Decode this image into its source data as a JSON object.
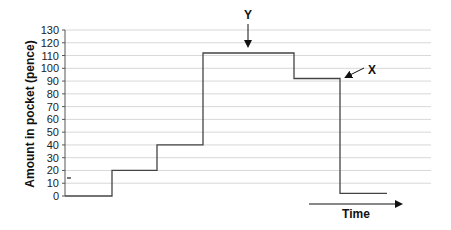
{
  "chart_data": {
    "type": "line",
    "subtype": "step",
    "title": "",
    "xlabel": "Time",
    "ylabel": "Amount in pocket (pence)",
    "ylim": [
      0,
      130
    ],
    "yticks": [
      0,
      10,
      20,
      30,
      40,
      50,
      60,
      70,
      80,
      90,
      100,
      110,
      120,
      130
    ],
    "grid": true,
    "legend": null,
    "series": [
      {
        "name": "Amount in pocket",
        "steps": [
          {
            "x_start": 0,
            "x_end": 1,
            "value": 0
          },
          {
            "x_start": 1,
            "x_end": 2,
            "value": 20
          },
          {
            "x_start": 2,
            "x_end": 3,
            "value": 40
          },
          {
            "x_start": 3,
            "x_end": 5,
            "value": 112
          },
          {
            "x_start": 5,
            "x_end": 6,
            "value": 92
          },
          {
            "x_start": 6,
            "x_end": 7,
            "value": 2
          }
        ]
      }
    ],
    "annotations": [
      {
        "label": "Y",
        "points_to": "top of 112 level (arrow pointing down)"
      },
      {
        "label": "X",
        "points_to": "right end of 92 level (arrow pointing down-left)"
      }
    ],
    "x_axis_arrow": {
      "label": "Time",
      "direction": "right"
    },
    "marker": {
      "value": 15,
      "note": "small mark near y-axis"
    }
  },
  "labels": {
    "y_axis_title": "Amount in pocket (pence)",
    "x_axis_title": "Time",
    "annotation_y": "Y",
    "annotation_x": "X"
  }
}
